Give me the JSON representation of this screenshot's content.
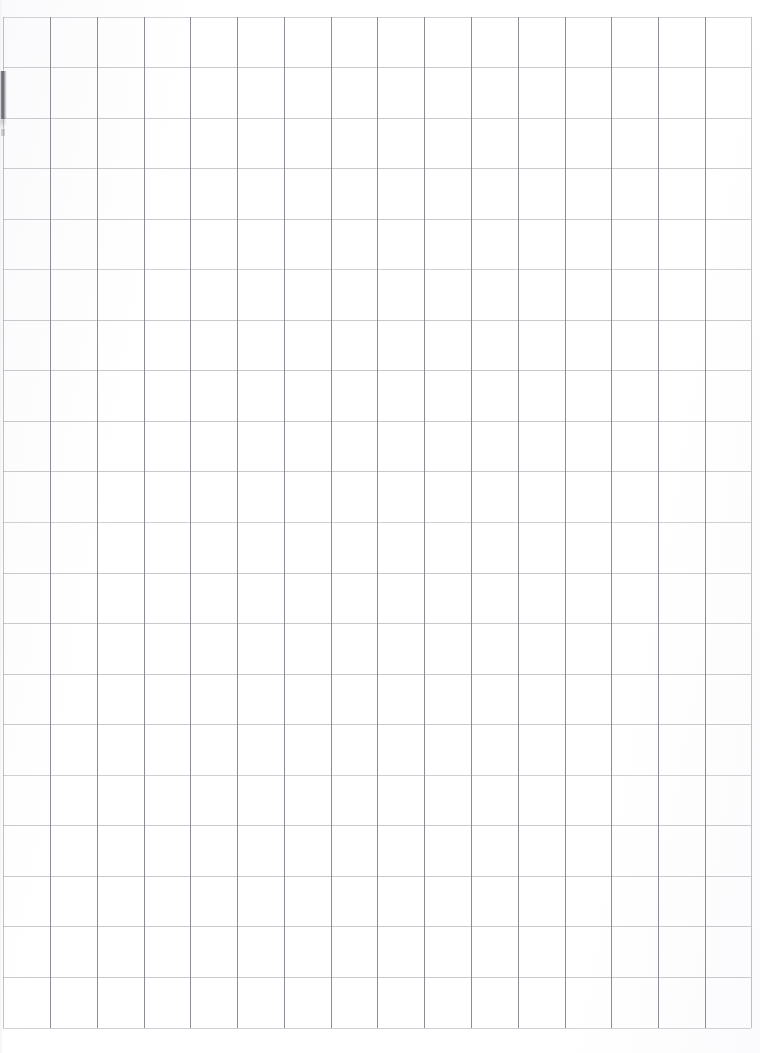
{
  "document": {
    "title": "Scanned Grid Paper Sheet",
    "kind": "blank-graph-paper-scan",
    "page_width_px": 760,
    "page_height_px": 1053,
    "background_color": "#ffffff",
    "content_text": "",
    "has_text": false,
    "description": "A blank scanned sheet of grid (graph) paper with no writing, printing, or annotations."
  },
  "grid": {
    "vertical_line_color": "#8d8d95",
    "horizontal_line_color": "#c9c9ce",
    "vertical_line_count": 17,
    "horizontal_line_count": 21,
    "cell_width_px": 47,
    "cell_height_px": 50.5,
    "grid_left_px": 3,
    "grid_right_px": 751,
    "grid_top_px": 17,
    "grid_bottom_px": 1028,
    "vertical_line_x": [
      3,
      50,
      97,
      144,
      190,
      237,
      284,
      331,
      377,
      424,
      471,
      518,
      565,
      611,
      658,
      705,
      751
    ],
    "horizontal_line_y": [
      17,
      67,
      118,
      168,
      219,
      269,
      320,
      370,
      421,
      471,
      522,
      573,
      623,
      674,
      724,
      775,
      825,
      876,
      926,
      977,
      1028
    ]
  },
  "artifacts": {
    "left_edge_smudge": {
      "name": "scan-smudge",
      "color": "#484850",
      "x_px": 0,
      "y_px": 71,
      "width_px": 7,
      "height_px": 48
    },
    "left_edge_mark": {
      "name": "scan-mark",
      "color": "#96969e",
      "x_px": 1,
      "y_px": 129,
      "width_px": 4,
      "height_px": 7
    }
  },
  "margins": {
    "top_px": 17,
    "left_px": 3,
    "right_px": 9,
    "bottom_px": 25
  }
}
